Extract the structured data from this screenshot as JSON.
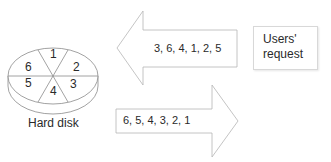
{
  "disk": {
    "label": "Hard disk",
    "sectors": [
      "1",
      "2",
      "3",
      "4",
      "5",
      "6"
    ]
  },
  "arrows": {
    "incoming": {
      "direction": "left",
      "text": "3, 6, 4, 1, 2, 5"
    },
    "outgoing": {
      "direction": "right",
      "text": "6, 5, 4, 3, 2, 1"
    }
  },
  "request_box": {
    "line1": "Users'",
    "line2": "request"
  },
  "colors": {
    "stroke": "#aaaaaa",
    "text": "#2a2a2a"
  }
}
